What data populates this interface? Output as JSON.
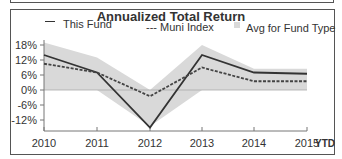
{
  "chart_data": {
    "type": "line",
    "title": "Annualized Total Return",
    "categories": [
      "2010",
      "2011",
      "2012",
      "2013",
      "2014",
      "2015"
    ],
    "x_suffix_label": "YTD",
    "series": [
      {
        "name": "This Fund",
        "style": "solid",
        "color": "#333333",
        "values": [
          14,
          7,
          -15,
          14,
          7,
          6.5
        ]
      },
      {
        "name": "Muni Index",
        "style": "dashed",
        "color": "#444444",
        "values": [
          10.5,
          7,
          -2.5,
          9,
          3.5,
          3.5
        ]
      }
    ],
    "band": {
      "name": "Avg for Fund Type",
      "color": "#d9d9d9",
      "upper": [
        19,
        13,
        0,
        18,
        8.5,
        8.5
      ],
      "lower": [
        0,
        0,
        -14.5,
        0,
        0,
        0
      ]
    },
    "yticks": [
      "18%",
      "12%",
      "6%",
      "0%",
      "-6%",
      "-12%"
    ],
    "ytick_values": [
      18,
      12,
      6,
      0,
      -6,
      -12
    ],
    "ylim": [
      -16,
      20
    ],
    "xlabel": "",
    "ylabel": "",
    "grid": false,
    "legend_position": "top"
  },
  "legend": {
    "fund": "This Fund",
    "muni": "--- Muni Index",
    "avg": "Avg for Fund Type"
  }
}
